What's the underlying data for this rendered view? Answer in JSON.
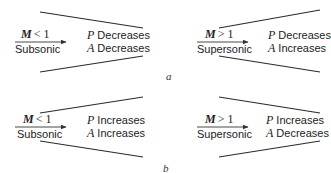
{
  "figure": {
    "panels": [
      {
        "id": "a",
        "label": "a",
        "diagrams": [
          {
            "shape": "converging-nozzle",
            "mach_symbol": "M",
            "mach_relation": "< 1",
            "regime": "Subsonic",
            "pressure_symbol": "P",
            "pressure_change": "Decreases",
            "area_symbol": "A",
            "area_change": "Decreases"
          },
          {
            "shape": "diverging-nozzle",
            "mach_symbol": "M",
            "mach_relation": "> 1",
            "regime": "Supersonic",
            "pressure_symbol": "P",
            "pressure_change": "Decreases",
            "area_symbol": "A",
            "area_change": "Increases"
          }
        ]
      },
      {
        "id": "b",
        "label": "b",
        "diagrams": [
          {
            "shape": "diverging-diffuser",
            "mach_symbol": "M",
            "mach_relation": "< 1",
            "regime": "Subsonic",
            "pressure_symbol": "P",
            "pressure_change": "Increases",
            "area_symbol": "A",
            "area_change": "Increases"
          },
          {
            "shape": "converging-diffuser",
            "mach_symbol": "M",
            "mach_relation": "> 1",
            "regime": "Supersonic",
            "pressure_symbol": "P",
            "pressure_change": "Increases",
            "area_symbol": "A",
            "area_change": "Decreases"
          }
        ]
      }
    ],
    "colors": {
      "line": "#2a2a2a",
      "text": "#222222",
      "background": "#ffffff"
    }
  }
}
